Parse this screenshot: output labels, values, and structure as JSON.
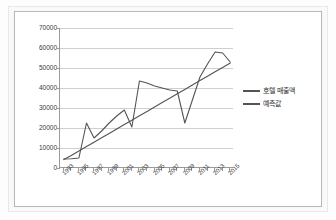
{
  "chart_data": {
    "type": "line",
    "title": "",
    "xlabel": "",
    "ylabel": "",
    "grid": true,
    "legend_position": "right",
    "ylim": [
      0,
      70000
    ],
    "ytick_labels": [
      "0",
      "10000",
      "20000",
      "30000",
      "40000",
      "50000",
      "60000",
      "70000"
    ],
    "ytick_values": [
      0,
      10000,
      20000,
      30000,
      40000,
      50000,
      60000,
      70000
    ],
    "xtick_labels": [
      "1993",
      "1995",
      "1997",
      "1999",
      "2001",
      "2003",
      "2005",
      "2007",
      "2009",
      "2011",
      "2013",
      "2015"
    ],
    "x": [
      1993,
      1994,
      1995,
      1996,
      1997,
      1998,
      1999,
      2000,
      2001,
      2002,
      2003,
      2004,
      2005,
      2006,
      2007,
      2008,
      2009,
      2010,
      2011,
      2012,
      2013,
      2014,
      2015
    ],
    "series": [
      {
        "name": "호텔 매출액",
        "color": "#545454",
        "values": [
          4500,
          4600,
          5000,
          22500,
          15000,
          18500,
          22500,
          26000,
          29000,
          20500,
          43500,
          42500,
          41000,
          40000,
          39000,
          38500,
          22500,
          34000,
          45500,
          52000,
          58000,
          57500,
          53000
        ]
      },
      {
        "name": "예측값",
        "color": "#545454",
        "values": [
          4200,
          6300,
          8500,
          10700,
          12900,
          15100,
          17300,
          19500,
          21700,
          23900,
          26100,
          28300,
          30500,
          32700,
          34900,
          37100,
          39300,
          41500,
          43700,
          45900,
          48100,
          50300,
          52500
        ]
      }
    ]
  },
  "legend": {
    "entries": [
      {
        "label": "호텔 매출액"
      },
      {
        "label": "예측값"
      }
    ]
  }
}
